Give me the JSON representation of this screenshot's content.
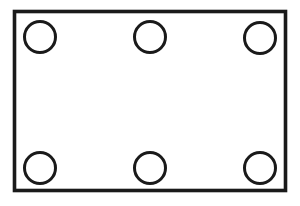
{
  "figure": {
    "type": "line-drawing",
    "canvas": {
      "width": 300,
      "height": 206,
      "background_color": "#ffffff"
    },
    "stroke_color": "#1a1a1a",
    "fill_color": "#ffffff",
    "plate": {
      "name": "outer-rectangle",
      "x": 14.5,
      "y": 11.5,
      "width": 271,
      "height": 179,
      "stroke_width": 3.6
    },
    "holes": {
      "count": 6,
      "radius": 15.5,
      "stroke_width": 3.0,
      "rows": [
        {
          "name": "top-row",
          "cy": 37,
          "centers_x": [
            40,
            150,
            260
          ]
        },
        {
          "name": "bottom-row",
          "cy": 168,
          "centers_x": [
            40,
            150,
            260
          ]
        }
      ],
      "items": [
        {
          "name": "hole-top-left",
          "cx": 40,
          "cy": 37,
          "r": 15.5
        },
        {
          "name": "hole-top-center",
          "cx": 150,
          "cy": 37,
          "r": 15.5
        },
        {
          "name": "hole-top-right",
          "cx": 260,
          "cy": 38,
          "r": 15.5
        },
        {
          "name": "hole-bottom-left",
          "cx": 40,
          "cy": 168,
          "r": 15.5
        },
        {
          "name": "hole-bottom-center",
          "cx": 150,
          "cy": 168,
          "r": 15.5
        },
        {
          "name": "hole-bottom-right",
          "cx": 260,
          "cy": 168,
          "r": 15.5
        }
      ]
    }
  }
}
